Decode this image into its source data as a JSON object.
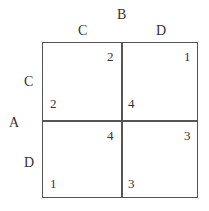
{
  "players": {
    "column_player": "B",
    "row_player": "A"
  },
  "strategies": {
    "columns": [
      "C",
      "D"
    ],
    "rows": [
      "C",
      "D"
    ]
  },
  "payoffs": {
    "CC": {
      "row": "2",
      "col": "2"
    },
    "CD": {
      "row": "4",
      "col": "1"
    },
    "DC": {
      "row": "1",
      "col": "4"
    },
    "DD": {
      "row": "3",
      "col": "3"
    }
  },
  "colors": {
    "line": "#555555",
    "text": "#333333",
    "background": "#ffffff"
  }
}
